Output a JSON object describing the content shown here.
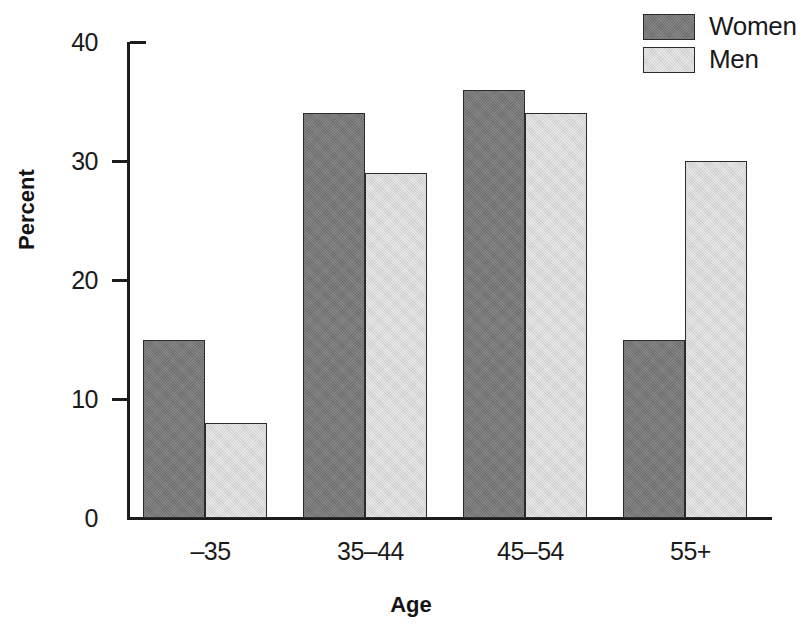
{
  "chart_data": {
    "type": "bar",
    "title": "",
    "subtitle": "",
    "xlabel": "Age",
    "ylabel": "Percent",
    "categories": [
      "–35",
      "35–44",
      "45–54",
      "55+"
    ],
    "series": [
      {
        "name": "Women",
        "values": [
          15,
          34,
          36,
          15
        ],
        "color": "#787878"
      },
      {
        "name": "Men",
        "values": [
          8,
          29,
          34,
          30
        ],
        "color": "#d9d9d9"
      }
    ],
    "ylim": [
      0,
      40
    ],
    "yticks": [
      0,
      10,
      20,
      30,
      40
    ],
    "ytick_labels": [
      "0",
      "10",
      "20",
      "30",
      "40"
    ],
    "grid": false,
    "legend_position": "top-right",
    "annotations": []
  },
  "axes": {
    "y_title": "Percent",
    "x_title": "Age"
  },
  "legend": {
    "entries": [
      {
        "label": "Women",
        "swatch": "legend-swatch-women"
      },
      {
        "label": "Men",
        "swatch": "legend-swatch-men"
      }
    ]
  },
  "colors": {
    "series_women": "#787878",
    "series_men": "#d9d9d9",
    "axis": "#1c1c1c",
    "text": "#1a1a1a",
    "background": "#ffffff"
  }
}
